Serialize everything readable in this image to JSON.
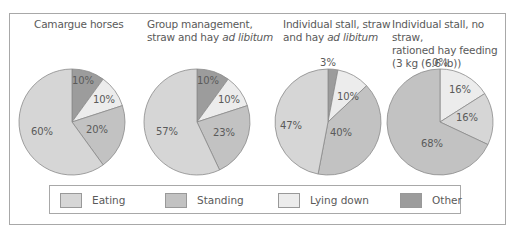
{
  "colors": {
    "eating": "#d6d6d6",
    "standing": "#c2c2c2",
    "lying_down": "#ececec",
    "other": "#9c9c9c",
    "border": "#a8a8a8"
  },
  "titles": [
    {
      "line1": "Camargue horses",
      "line2": "",
      "line3": ""
    },
    {
      "line1": "Group management,",
      "line2": "straw and hay ",
      "line2_italic": "ad libitum",
      "line3": ""
    },
    {
      "line1": "Individual stall, straw",
      "line2": "and hay ",
      "line2_italic": "ad libitum",
      "line3": ""
    },
    {
      "line1": "Individual stall, no straw,",
      "line2": "rationed hay feeding",
      "line3": "(3 kg (6.6 lb))"
    }
  ],
  "legend": [
    {
      "label": "Eating",
      "key": "eating"
    },
    {
      "label": "Standing",
      "key": "standing"
    },
    {
      "label": "Lying down",
      "key": "lying_down"
    },
    {
      "label": "Other",
      "key": "other"
    }
  ],
  "chart_data": {
    "type": "pie",
    "title": "",
    "categories": [
      "Other",
      "Lying down",
      "Standing",
      "Eating"
    ],
    "pies": [
      {
        "title": "Camargue horses",
        "values": {
          "Other": 10,
          "Lying down": 10,
          "Standing": 20,
          "Eating": 60
        },
        "labels": [
          "10%",
          "10%",
          "20%",
          "60%"
        ]
      },
      {
        "title": "Group management, straw and hay ad libitum",
        "values": {
          "Other": 10,
          "Lying down": 10,
          "Standing": 23,
          "Eating": 57
        },
        "labels": [
          "10%",
          "10%",
          "23%",
          "57%"
        ]
      },
      {
        "title": "Individual stall, straw and hay ad libitum",
        "values": {
          "Other": 3,
          "Lying down": 10,
          "Standing": 40,
          "Eating": 47
        },
        "labels": [
          "3%",
          "10%",
          "40%",
          "47%"
        ]
      },
      {
        "title": "Individual stall, no straw, rationed hay feeding (3 kg (6.6 lb))",
        "values": {
          "Other": 0,
          "Lying down": 16,
          "Eating": 16,
          "Standing": 68
        },
        "labels": [
          "0%",
          "16%",
          "16%",
          "68%"
        ]
      }
    ],
    "legend_position": "bottom"
  }
}
